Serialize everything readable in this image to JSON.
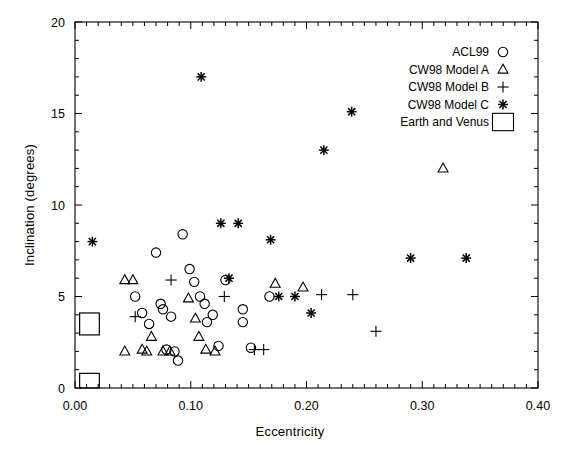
{
  "chart_data": {
    "type": "scatter",
    "title": "",
    "xlabel": "Eccentricity",
    "ylabel": "Inclination (degrees)",
    "xlim": [
      0.0,
      0.4
    ],
    "ylim": [
      0,
      20
    ],
    "xticks": [
      0.0,
      0.1,
      0.2,
      0.3,
      0.4
    ],
    "xticklabels": [
      "0.00",
      "0.10",
      "0.20",
      "0.30",
      "0.40"
    ],
    "yticks": [
      0,
      5,
      10,
      15,
      20
    ],
    "yticklabels": [
      "0",
      "5",
      "10",
      "15",
      "20"
    ],
    "x_minor_tick_step": 0.01,
    "y_minor_tick_step": 1,
    "grid": false,
    "legend_position": "top-right",
    "series": [
      {
        "name": "ACL99",
        "marker": "circle",
        "points": [
          [
            0.052,
            5.0
          ],
          [
            0.058,
            4.1
          ],
          [
            0.064,
            3.5
          ],
          [
            0.07,
            7.4
          ],
          [
            0.074,
            4.6
          ],
          [
            0.076,
            4.3
          ],
          [
            0.079,
            2.1
          ],
          [
            0.083,
            3.9
          ],
          [
            0.086,
            2.0
          ],
          [
            0.089,
            1.5
          ],
          [
            0.093,
            8.4
          ],
          [
            0.099,
            6.5
          ],
          [
            0.103,
            5.8
          ],
          [
            0.108,
            5.0
          ],
          [
            0.112,
            4.6
          ],
          [
            0.114,
            3.6
          ],
          [
            0.119,
            4.0
          ],
          [
            0.124,
            2.3
          ],
          [
            0.13,
            5.9
          ],
          [
            0.145,
            4.3
          ],
          [
            0.145,
            3.6
          ],
          [
            0.152,
            2.2
          ],
          [
            0.168,
            5.0
          ]
        ]
      },
      {
        "name": "CW98 Model A",
        "marker": "triangle",
        "points": [
          [
            0.043,
            5.9
          ],
          [
            0.05,
            5.9
          ],
          [
            0.043,
            2.0
          ],
          [
            0.058,
            2.1
          ],
          [
            0.062,
            2.0
          ],
          [
            0.066,
            2.8
          ],
          [
            0.076,
            2.0
          ],
          [
            0.082,
            2.0
          ],
          [
            0.098,
            4.9
          ],
          [
            0.104,
            3.8
          ],
          [
            0.107,
            2.8
          ],
          [
            0.113,
            2.1
          ],
          [
            0.121,
            2.0
          ],
          [
            0.173,
            5.7
          ],
          [
            0.197,
            5.5
          ],
          [
            0.318,
            12.0
          ]
        ]
      },
      {
        "name": "CW98 Model B",
        "marker": "plus",
        "points": [
          [
            0.052,
            3.9
          ],
          [
            0.083,
            5.9
          ],
          [
            0.129,
            5.0
          ],
          [
            0.155,
            2.1
          ],
          [
            0.163,
            2.1
          ],
          [
            0.213,
            5.1
          ],
          [
            0.24,
            5.1
          ],
          [
            0.26,
            3.1
          ]
        ]
      },
      {
        "name": "CW98 Model C",
        "marker": "asterisk",
        "points": [
          [
            0.015,
            8.0
          ],
          [
            0.109,
            17.0
          ],
          [
            0.126,
            9.0
          ],
          [
            0.141,
            9.0
          ],
          [
            0.133,
            6.0
          ],
          [
            0.169,
            8.1
          ],
          [
            0.176,
            5.0
          ],
          [
            0.19,
            5.0
          ],
          [
            0.204,
            4.1
          ],
          [
            0.215,
            13.0
          ],
          [
            0.239,
            15.1
          ],
          [
            0.29,
            7.1
          ],
          [
            0.338,
            7.1
          ]
        ]
      }
    ],
    "boxes": [
      {
        "name": "earth-box",
        "x0": 0.004,
        "x1": 0.021,
        "y0": 0.0,
        "y1": 0.8
      },
      {
        "name": "venus-box",
        "x0": 0.004,
        "x1": 0.021,
        "y0": 2.9,
        "y1": 4.1
      }
    ],
    "legend": [
      {
        "label": "ACL99",
        "marker": "circle"
      },
      {
        "label": "CW98 Model A",
        "marker": "triangle"
      },
      {
        "label": "CW98 Model B",
        "marker": "plus"
      },
      {
        "label": "CW98 Model C",
        "marker": "asterisk"
      },
      {
        "label": "Earth and Venus",
        "marker": "box"
      }
    ],
    "colors": {
      "foreground": "#000000",
      "background": "#ffffff"
    }
  }
}
